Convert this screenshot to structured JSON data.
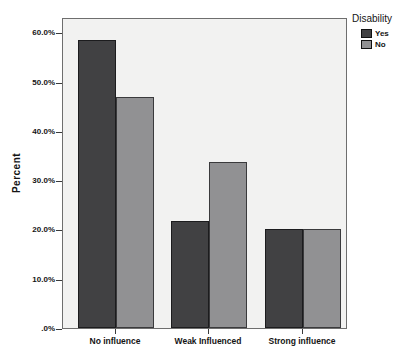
{
  "chart_data": {
    "type": "bar",
    "title": "",
    "xlabel": "",
    "ylabel": "Percent",
    "categories": [
      "No influence",
      "Weak Influenced",
      "Strong influence"
    ],
    "series": [
      {
        "name": "Yes",
        "color": "#414143",
        "border_color": "#1c1c1e",
        "values": [
          58.5,
          21.7,
          20.0
        ]
      },
      {
        "name": "No",
        "color": "#919193",
        "border_color": "#3a3a3c",
        "values": [
          46.8,
          33.7,
          20.0
        ]
      }
    ],
    "legend": {
      "title": "Disability",
      "position": "top-right"
    },
    "yticks": [
      {
        "label": "60.0%",
        "value": 60
      },
      {
        "label": "50.0%",
        "value": 50
      },
      {
        "label": "40.0%",
        "value": 40
      },
      {
        "label": "30.0%",
        "value": 30
      },
      {
        "label": "20.0%",
        "value": 20
      },
      {
        "label": "10.0%",
        "value": 10
      },
      {
        "label": ".0%",
        "value": 0
      }
    ],
    "ylim": [
      0,
      63.1
    ],
    "grid": false,
    "plot_background": "#f2f2f1",
    "frame_color": "#6e6e6e"
  }
}
